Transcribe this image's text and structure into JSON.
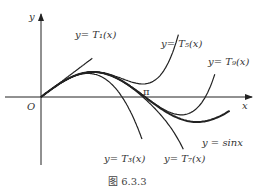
{
  "figure": {
    "caption": "图 6.3.3",
    "axes": {
      "x_label": "x",
      "y_label": "y",
      "origin_label": "O",
      "pi_label": "π"
    },
    "curves": [
      {
        "id": "T1",
        "label": "y= T₁(x)",
        "degree": 1
      },
      {
        "id": "T3",
        "label": "y= T₃(x)",
        "degree": 3
      },
      {
        "id": "T5",
        "label": "y= T₅(x)",
        "degree": 5
      },
      {
        "id": "T7",
        "label": "y= T₇(x)",
        "degree": 7
      },
      {
        "id": "T9",
        "label": "y= T₉(x)",
        "degree": 9
      },
      {
        "id": "sin",
        "label": "y = sinx",
        "function": "sin"
      }
    ],
    "colors": {
      "ink": "#222222"
    }
  }
}
